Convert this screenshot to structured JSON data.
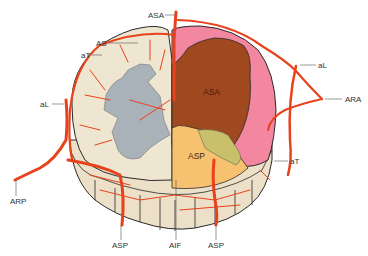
{
  "figure": {
    "type": "anatomical-illustration",
    "labels": {
      "asa_top": "ASA",
      "as": "AS",
      "at_left": "aT",
      "al_left": "aL",
      "arp": "ARP",
      "asp_left": "ASP",
      "aif": "AIF",
      "asp_right": "ASP",
      "at_right": "aT",
      "ara": "ARA",
      "al_right": "aL",
      "asa_region": "ASA",
      "asp_region": "ASP"
    },
    "colors": {
      "artery": "#e8421c",
      "white_matter": "#efe6d2",
      "grey_matter": "#a9b1b9",
      "asa_territory": "#a0481f",
      "pink_zone": "#f2879f",
      "asp_territory": "#f6c270",
      "olive_zone": "#c8c06a",
      "outline": "#2a2a2a",
      "label_text": "#333333"
    }
  }
}
